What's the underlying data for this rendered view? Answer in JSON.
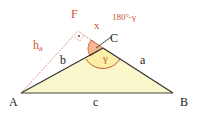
{
  "diagram": {
    "colors": {
      "fill": "#fbf7cc",
      "stroke": "#333333",
      "accent": "#c8552e",
      "angle_fill": "#f3b892",
      "altitude": "#d45a4a"
    },
    "points": {
      "A": {
        "label": "A",
        "x": 21,
        "y": 93
      },
      "B": {
        "label": "B",
        "x": 173,
        "y": 93
      },
      "C": {
        "label": "C",
        "x": 103,
        "y": 48
      },
      "F": {
        "label": "F",
        "x": 78,
        "y": 31
      }
    },
    "sides": {
      "a": "a",
      "b": "b",
      "c": "c"
    },
    "altitude_label": "h",
    "altitude_sub": "a",
    "angles": {
      "gamma": "γ",
      "x": "x",
      "exterior": "180°-γ"
    }
  }
}
